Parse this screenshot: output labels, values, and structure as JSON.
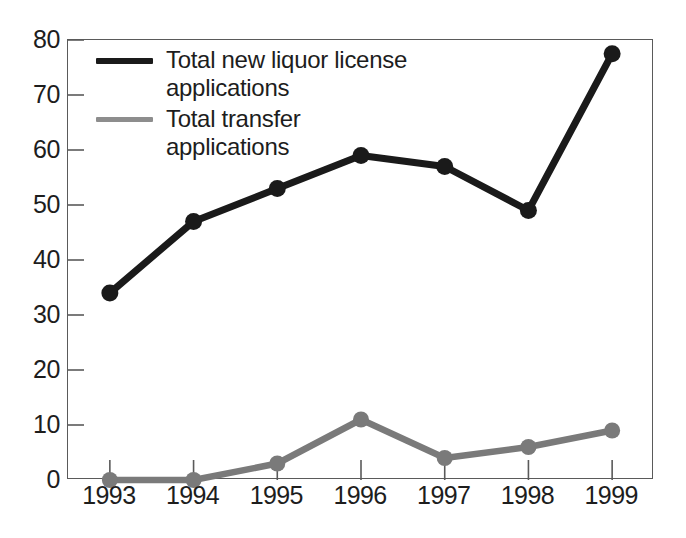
{
  "chart_data": {
    "type": "line",
    "title": "",
    "subtitle": "",
    "xlabel": "",
    "ylabel": "",
    "categories": [
      "1993",
      "1994",
      "1995",
      "1996",
      "1997",
      "1998",
      "1999"
    ],
    "x": [
      1993,
      1994,
      1995,
      1996,
      1997,
      1998,
      1999
    ],
    "ylim": [
      0,
      80
    ],
    "yticks": [
      0,
      10,
      20,
      30,
      40,
      50,
      60,
      70,
      80
    ],
    "ytick_labels": [
      "0",
      "10",
      "20",
      "30",
      "40",
      "50",
      "60",
      "70",
      "80"
    ],
    "grid": false,
    "legend_position": "upper-left-inside",
    "series": [
      {
        "name": "Total new liquor license applications",
        "legend_label": "Total new liquor license\napplications",
        "color": "#1a1a1a",
        "marker": "filled-circle",
        "values": [
          34,
          47,
          53,
          59,
          57,
          49,
          77.5
        ]
      },
      {
        "name": "Total transfer applications",
        "legend_label": "Total transfer applications",
        "color": "#7a7a7a",
        "marker": "filled-circle",
        "values": [
          0,
          0,
          3,
          11,
          4,
          6,
          9
        ]
      }
    ]
  },
  "axes": {
    "frame_color": "#5a5a5a",
    "tick_color": "#5a5a5a",
    "background": "#ffffff"
  },
  "legend": {
    "items": [
      {
        "label": "Total new liquor license\napplications",
        "color": "#1a1a1a"
      },
      {
        "label": "Total transfer applications",
        "color": "#7a7a7a"
      }
    ]
  }
}
